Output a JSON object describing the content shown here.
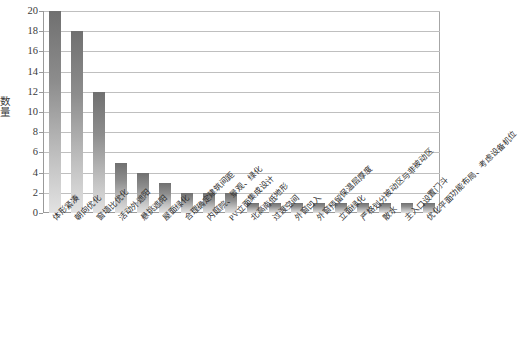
{
  "chart_data": {
    "type": "bar",
    "title": "",
    "xlabel": "",
    "ylabel": "数量",
    "ylim": [
      0,
      20
    ],
    "ytick_step": 2,
    "yticks": [
      0,
      2,
      4,
      6,
      8,
      10,
      12,
      14,
      16,
      18,
      20
    ],
    "grid": true,
    "legend": null,
    "orientation": "vertical",
    "bar_fill": "vertical-gradient-gray",
    "colors": {
      "bar_top": "#707070",
      "bar_bottom": "#e2e2e2",
      "gridline": "#bfbfbf",
      "axis": "#9a9a9a",
      "text": "#2e2e2e"
    },
    "categories": [
      "体形紧凑",
      "朝向优化",
      "窗墙比优化",
      "活动外遮阳",
      "悬挑遮阳",
      "屋面绿化",
      "合理确定建筑间距",
      "内庭院、景观、绿化",
      "PV立面集成设计",
      "北高南低地形",
      "过渡空间",
      "外窗凹入",
      "外窗预留保温层厚度",
      "立面绿化",
      "严格划分被动区与非被动区",
      "散水",
      "主入口设置门斗",
      "优化平面功能布局、考虑设备机位"
    ],
    "values": [
      20,
      18,
      12,
      5,
      4,
      3,
      2,
      2,
      2,
      1,
      1,
      1,
      1,
      1,
      1,
      1,
      1,
      1
    ]
  }
}
